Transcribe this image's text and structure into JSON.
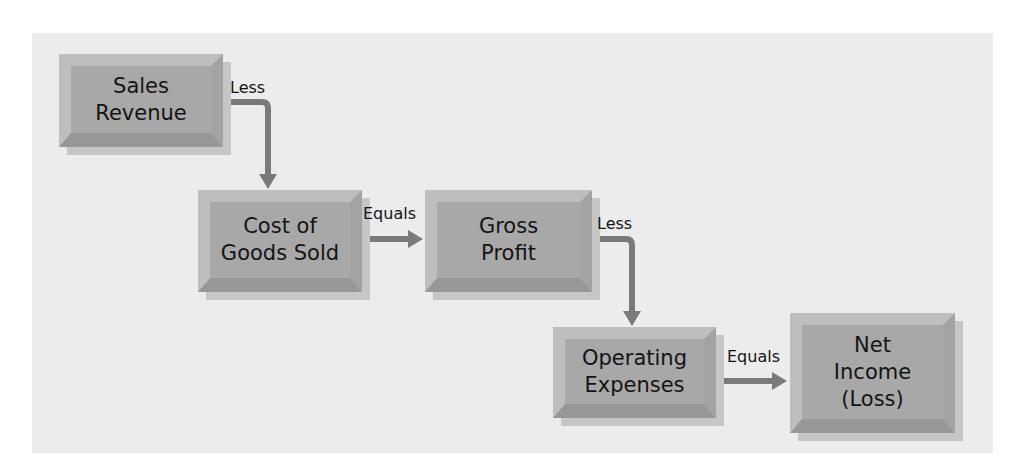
{
  "diagram": {
    "type": "flowchart",
    "title": "",
    "colors": {
      "panel_background": "#ececec",
      "box_face": "#a8a8a8",
      "box_bevel": "#bebebe",
      "box_shadow": "#c6c6c6",
      "arrow": "#7a7a7a",
      "text": "#141414"
    },
    "nodes": [
      {
        "id": "sales_revenue",
        "lines": [
          "Sales",
          "Revenue"
        ]
      },
      {
        "id": "cost_of_goods_sold",
        "lines": [
          "Cost of",
          "Goods Sold"
        ]
      },
      {
        "id": "gross_profit",
        "lines": [
          "Gross",
          "Profit"
        ]
      },
      {
        "id": "operating_expenses",
        "lines": [
          "Operating",
          "Expenses"
        ]
      },
      {
        "id": "net_income",
        "lines": [
          "Net",
          "Income",
          "(Loss)"
        ]
      }
    ],
    "edges": [
      {
        "from": "sales_revenue",
        "to": "cost_of_goods_sold",
        "label": "Less"
      },
      {
        "from": "cost_of_goods_sold",
        "to": "gross_profit",
        "label": "Equals"
      },
      {
        "from": "gross_profit",
        "to": "operating_expenses",
        "label": "Less"
      },
      {
        "from": "operating_expenses",
        "to": "net_income",
        "label": "Equals"
      }
    ]
  }
}
